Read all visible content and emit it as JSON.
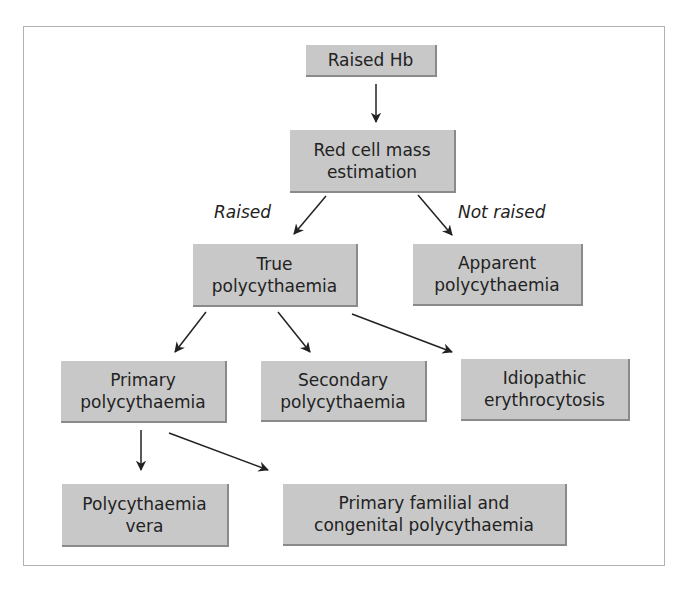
{
  "diagram": {
    "type": "flowchart",
    "nodes": {
      "raised_hb": "Raised Hb",
      "red_cell_mass": "Red cell mass\nestimation",
      "true_poly": "True\npolycythaemia",
      "apparent_poly": "Apparent\npolycythaemia",
      "primary_poly": "Primary\npolycythaemia",
      "secondary_poly": "Secondary\npolycythaemia",
      "idiopathic": "Idiopathic\nerythrocytosis",
      "poly_vera": "Polycythaemia\nvera",
      "primary_familial": "Primary familial and\ncongenital polycythaemia"
    },
    "edge_labels": {
      "raised": "Raised",
      "not_raised": "Not raised"
    },
    "edges": [
      {
        "from": "raised_hb",
        "to": "red_cell_mass"
      },
      {
        "from": "red_cell_mass",
        "to": "true_poly",
        "label": "Raised"
      },
      {
        "from": "red_cell_mass",
        "to": "apparent_poly",
        "label": "Not raised"
      },
      {
        "from": "true_poly",
        "to": "primary_poly"
      },
      {
        "from": "true_poly",
        "to": "secondary_poly"
      },
      {
        "from": "true_poly",
        "to": "idiopathic"
      },
      {
        "from": "primary_poly",
        "to": "poly_vera"
      },
      {
        "from": "primary_poly",
        "to": "primary_familial"
      }
    ],
    "colors": {
      "node_fill": "#c8c8c8",
      "node_shadow": "#8a8a8a",
      "text": "#222222",
      "arrow": "#222222",
      "frame": "#b0b0b0"
    }
  }
}
